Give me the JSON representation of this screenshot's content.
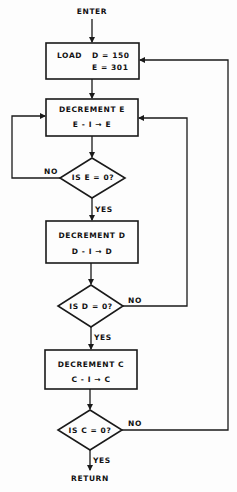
{
  "flowchart": {
    "enter_label": "ENTER",
    "return_label": "RETURN",
    "load_box": {
      "title": "LOAD",
      "line1": "D = 150",
      "line2": "E = 301"
    },
    "decrement_e": {
      "title": "DECREMENT  E",
      "operation": "E - I → E"
    },
    "decision_e": {
      "question": "IS  E = 0?",
      "yes_label": "YES",
      "no_label": "NO"
    },
    "decrement_d": {
      "title": "DECREMENT  D",
      "operation": "D - I → D"
    },
    "decision_d": {
      "question": "IS  D = 0?",
      "yes_label": "YES",
      "no_label": "NO"
    },
    "decrement_c": {
      "title": "DECREMENT  C",
      "operation": "C - I → C"
    },
    "decision_c": {
      "question": "IS  C = 0?",
      "yes_label": "YES",
      "no_label": "NO"
    }
  },
  "colors": {
    "line": "#1a1a1a",
    "background": "#fdfdfd"
  }
}
